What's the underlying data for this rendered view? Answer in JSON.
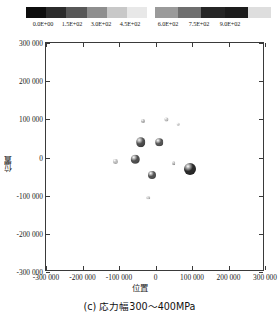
{
  "colorbar": {
    "name": "grayscale-colorbar",
    "tick_labels": [
      "0.0E+00",
      "1.5E+02",
      "3.0E+02",
      "4.5E+02",
      "6.0E+02",
      "7.5E+02",
      "9.0E+02"
    ],
    "tick_positions_px": [
      43,
      72,
      101,
      130,
      168,
      199,
      230
    ],
    "segments_left": [
      "#0d0d0d",
      "#2b2b2b",
      "#575757",
      "#8e8e8e",
      "#c8c8c8",
      "#e8e8e8"
    ],
    "segments_right": [
      "#9a9a9a",
      "#6e6e6e",
      "#262626",
      "#1c1c1c",
      "#dedede"
    ],
    "range_min": "0.0E+00",
    "range_max": "9.0E+02"
  },
  "chart_data": {
    "type": "scatter",
    "title": "",
    "xlabel": "位置",
    "ylabel": "位置",
    "xlim": [
      -300000,
      300000
    ],
    "ylim": [
      -300000,
      300000
    ],
    "grid": false,
    "legend": "colorbar-top",
    "xticks": [
      -300000,
      -200000,
      -100000,
      0,
      100000,
      200000,
      300000
    ],
    "yticks": [
      -300000,
      -200000,
      -100000,
      0,
      100000,
      200000,
      300000
    ],
    "xtick_labels": [
      "-300 000",
      "-200 000",
      "-100 000",
      "0",
      "100 000",
      "200 000",
      "300 000"
    ],
    "ytick_labels": [
      "300 000",
      "200 000",
      "100 000",
      "0",
      "-100 000",
      "-200 000",
      "-300 000"
    ],
    "colorbar_label": "",
    "points": [
      {
        "x": -40000,
        "y": 40000,
        "size_px": 9.5,
        "color": "#4a4a4a",
        "value": 640
      },
      {
        "x": 10000,
        "y": 40000,
        "size_px": 7.5,
        "color": "#555555",
        "value": 600
      },
      {
        "x": -55000,
        "y": -5000,
        "size_px": 8.5,
        "color": "#4f4f4f",
        "value": 620
      },
      {
        "x": -10000,
        "y": -45000,
        "size_px": 8.0,
        "color": "#525252",
        "value": 610
      },
      {
        "x": 95000,
        "y": -30000,
        "size_px": 12.0,
        "color": "#2a2a2a",
        "value": 880
      },
      {
        "x": -35000,
        "y": 95000,
        "size_px": 4.0,
        "color": "#b0b0b0",
        "value": 210
      },
      {
        "x": 30000,
        "y": 100000,
        "size_px": 3.2,
        "color": "#bdbdbd",
        "value": 180
      },
      {
        "x": -110000,
        "y": -10000,
        "size_px": 4.2,
        "color": "#bcbcbc",
        "value": 190
      },
      {
        "x": 50000,
        "y": -15000,
        "size_px": 3.6,
        "color": "#b5b5b5",
        "value": 200
      },
      {
        "x": -20000,
        "y": -105000,
        "size_px": 3.4,
        "color": "#c2c2c2",
        "value": 170
      },
      {
        "x": 62000,
        "y": 88000,
        "size_px": 2.6,
        "color": "#cacaca",
        "value": 150
      }
    ]
  },
  "caption": {
    "text": "(c) 応力幅300～400MPa"
  }
}
